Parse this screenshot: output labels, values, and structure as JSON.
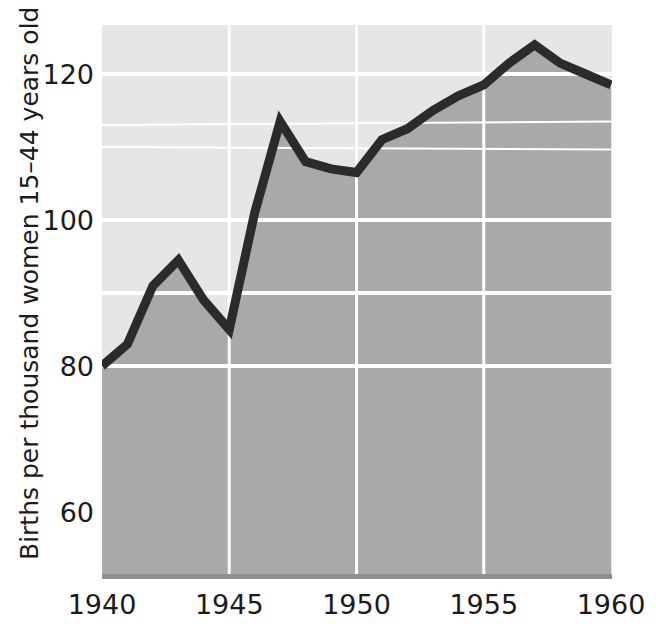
{
  "chart_data": {
    "type": "line",
    "title": "",
    "subtitle": "",
    "xlabel": "",
    "ylabel": "Births per thousand women 15–44 years old",
    "xlim": [
      1940,
      1960
    ],
    "ylim": [
      48,
      129
    ],
    "xticks": [
      1940,
      1945,
      1950,
      1955,
      1960
    ],
    "xtick_labels": [
      "1940",
      "1945",
      "1950",
      "1955",
      "1960"
    ],
    "yticks": [
      60,
      80,
      100,
      120
    ],
    "ytick_labels": [
      "60",
      "80",
      "100",
      "120"
    ],
    "grid": {
      "horizontal": true,
      "vertical": true,
      "horizontal_values": [
        80,
        90,
        100,
        110,
        113,
        120
      ],
      "vertical_values": [
        1945,
        1950,
        1955
      ],
      "color": "#ffffff"
    },
    "legend": {
      "visible": false,
      "position": "none"
    },
    "area_fill": true,
    "x": [
      1940,
      1941,
      1942,
      1943,
      1944,
      1945,
      1946,
      1947,
      1948,
      1949,
      1950,
      1951,
      1952,
      1953,
      1954,
      1955,
      1956,
      1957,
      1958,
      1959,
      1960
    ],
    "values": [
      80,
      83,
      91,
      94.5,
      89,
      85,
      101,
      113.5,
      108,
      107,
      106.5,
      111,
      112.5,
      115,
      117,
      118.5,
      121.5,
      124,
      121.5,
      120,
      118.5
    ],
    "series": [
      {
        "name": "Birth rate",
        "values": [
          80,
          83,
          91,
          94.5,
          89,
          85,
          101,
          113.5,
          108,
          107,
          106.5,
          111,
          112.5,
          115,
          117,
          118.5,
          121.5,
          124,
          121.5,
          120,
          118.5
        ]
      }
    ]
  },
  "colors": {
    "line": "#2b2b2b",
    "area_fill": "#a9a9a9",
    "plot_background": "#e6e6e6",
    "grid": "#ffffff",
    "axis_text": "#1b1b1b",
    "page_background": "#ffffff",
    "baseline": "#8f8f8f"
  }
}
